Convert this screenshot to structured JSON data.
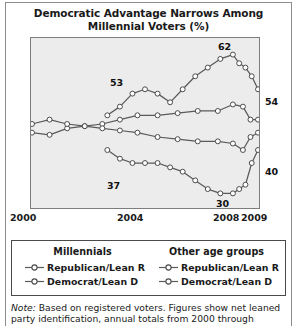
{
  "title": {
    "line1": "Democratic Advantage Narrows Among",
    "line2": "Millennial Voters (%)"
  },
  "annotations": {
    "mill_dem_peak": "62",
    "mill_dem_start": "53",
    "mill_rep_start": "37",
    "mill_rep_low": "30",
    "mill_dem_end": "54",
    "mill_rep_end": "40"
  },
  "axis": {
    "ticks": [
      "2000",
      "2004",
      "2008",
      "2009"
    ]
  },
  "legend": {
    "groups": [
      {
        "heading": "Millennials",
        "entries": [
          {
            "label": "Republican/Lean R",
            "marker": "open-circle-line-icon"
          },
          {
            "label": "Democrat/Lean D",
            "marker": "open-circle-line-icon"
          }
        ]
      },
      {
        "heading": "Other age groups",
        "entries": [
          {
            "label": "Republican/Lean R",
            "marker": "open-circle-line-icon"
          },
          {
            "label": "Democrat/Lean D",
            "marker": "open-circle-line-icon"
          }
        ]
      }
    ]
  },
  "note": {
    "prefix": "Note:",
    "line1": " Based on registered voters. Figures show net leaned",
    "line2": "party identification, annual totals from 2000 through"
  },
  "colors": {
    "plot_background": "#ececec",
    "plot_border": "#7d7d7d",
    "line": "#5a5a5a",
    "marker_fill": "#ffffff",
    "text": "#1a1a1a",
    "frame": "#8c8c8c"
  },
  "chart_data": {
    "type": "line",
    "title": "Democratic Advantage Narrows Among Millennial Voters (%)",
    "xlabel": "",
    "ylabel": "",
    "xlim": [
      2000,
      2009
    ],
    "ylim": [
      28,
      64
    ],
    "grid": false,
    "legend_position": "below",
    "x_ticks": [
      2000,
      2004,
      2008,
      2009
    ],
    "series": [
      {
        "name": "Millennials Democrat/Lean D",
        "group": "Millennials",
        "party": "Democrat/Lean D",
        "x": [
          2003.0,
          2003.5,
          2004.0,
          2004.5,
          2005.0,
          2005.5,
          2006.0,
          2006.5,
          2007.0,
          2007.5,
          2008.0,
          2008.25,
          2008.5,
          2008.75,
          2009.0
        ],
        "values": [
          48,
          50,
          53,
          54,
          53,
          51,
          54,
          57,
          59,
          61,
          62,
          60,
          59,
          57,
          54
        ],
        "labeled_points": [
          {
            "x": 2004.0,
            "value": 53,
            "label": "53"
          },
          {
            "x": 2008.0,
            "value": 62,
            "label": "62"
          },
          {
            "x": 2009.0,
            "value": 54,
            "label": "54"
          }
        ]
      },
      {
        "name": "Millennials Republican/Lean R",
        "group": "Millennials",
        "party": "Republican/Lean R",
        "x": [
          2003.0,
          2003.5,
          2004.0,
          2004.5,
          2005.0,
          2005.5,
          2006.0,
          2006.5,
          2007.0,
          2007.5,
          2008.0,
          2008.25,
          2008.5,
          2008.75,
          2009.0
        ],
        "values": [
          40,
          38,
          37,
          37,
          37,
          36,
          35,
          33,
          31,
          30,
          30,
          31,
          32,
          37,
          40
        ],
        "labeled_points": [
          {
            "x": 2004.0,
            "value": 37,
            "label": "37"
          },
          {
            "x": 2007.8,
            "value": 30,
            "label": "30"
          },
          {
            "x": 2009.0,
            "value": 40,
            "label": "40"
          }
        ]
      },
      {
        "name": "Other age groups Democrat/Lean D",
        "group": "Other age groups",
        "party": "Democrat/Lean D",
        "x": [
          2000.0,
          2000.7,
          2001.4,
          2002.1,
          2002.8,
          2003.5,
          2004.2,
          2005.0,
          2005.8,
          2006.6,
          2007.4,
          2008.0,
          2008.4,
          2008.7,
          2009.0
        ],
        "values": [
          44,
          43.5,
          45,
          45.5,
          46,
          47,
          48,
          48,
          48.5,
          49,
          49,
          50.5,
          50,
          47,
          47
        ],
        "labeled_points": []
      },
      {
        "name": "Other age groups Republican/Lean R",
        "group": "Other age groups",
        "party": "Republican/Lean R",
        "x": [
          2000.0,
          2000.7,
          2001.4,
          2002.1,
          2002.8,
          2003.5,
          2004.2,
          2005.0,
          2005.8,
          2006.6,
          2007.4,
          2008.0,
          2008.4,
          2008.7,
          2009.0
        ],
        "values": [
          46,
          47,
          46,
          45.5,
          45,
          44.5,
          44,
          43,
          42.5,
          42,
          42,
          41.5,
          40,
          43,
          44
        ],
        "labeled_points": []
      }
    ]
  }
}
